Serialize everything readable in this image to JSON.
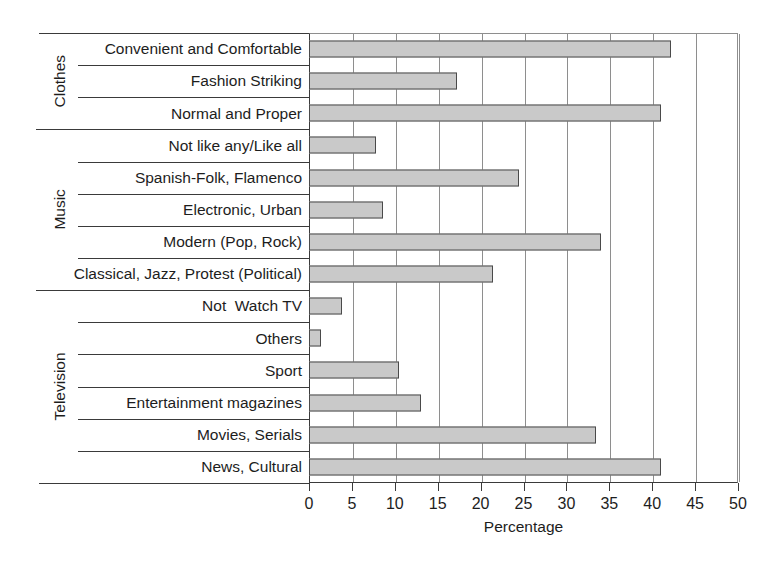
{
  "chart_data": {
    "type": "bar",
    "orientation": "horizontal",
    "title": "",
    "xlabel": "Percentage",
    "ylabel": "",
    "xlim": [
      0,
      50
    ],
    "xticks": [
      0,
      5,
      10,
      15,
      20,
      25,
      30,
      35,
      40,
      45,
      50
    ],
    "grid": "vertical",
    "legend": "none",
    "bar_color": "#c9c9c9",
    "bar_edge_color": "#4a4a4a",
    "groups": [
      {
        "name": "Clothes",
        "categories": [
          "Convenient and Comfortable",
          "Fashion Striking",
          "Normal and Proper"
        ],
        "values": [
          42.2,
          17.2,
          41.0
        ]
      },
      {
        "name": "Music",
        "categories": [
          "Not like any/Like all",
          "Spanish-Folk, Flamenco",
          "Electronic, Urban",
          "Modern (Pop, Rock)",
          "Classical, Jazz, Protest (Political)"
        ],
        "values": [
          7.8,
          24.5,
          8.6,
          34.0,
          21.5
        ]
      },
      {
        "name": "Television",
        "categories": [
          "Not  Watch TV",
          "Others",
          "Sport",
          "Entertainment magazines",
          "Movies, Serials",
          "News, Cultural"
        ],
        "values": [
          3.8,
          1.4,
          10.5,
          13.0,
          33.4,
          41.0
        ]
      }
    ],
    "categories": [
      "Convenient and Comfortable",
      "Fashion Striking",
      "Normal and Proper",
      "Not like any/Like all",
      "Spanish-Folk, Flamenco",
      "Electronic, Urban",
      "Modern (Pop, Rock)",
      "Classical, Jazz, Protest (Political)",
      "Not  Watch TV",
      "Others",
      "Sport",
      "Entertainment magazines",
      "Movies, Serials",
      "News, Cultural"
    ],
    "values": [
      42.2,
      17.2,
      41.0,
      7.8,
      24.5,
      8.6,
      34.0,
      21.5,
      3.8,
      1.4,
      10.5,
      13.0,
      33.4,
      41.0
    ]
  }
}
